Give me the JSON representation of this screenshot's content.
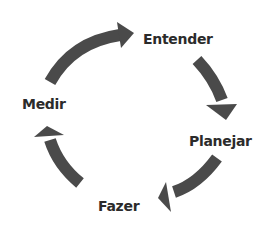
{
  "diagram": {
    "type": "cycle",
    "arrow_color": "#4a4a4a",
    "text_color": "#2b2b2b",
    "steps": [
      {
        "label": "Entender"
      },
      {
        "label": "Planejar"
      },
      {
        "label": "Fazer"
      },
      {
        "label": "Medir"
      }
    ],
    "flow": [
      "Entender",
      "Planejar",
      "Fazer",
      "Medir",
      "Entender"
    ]
  }
}
